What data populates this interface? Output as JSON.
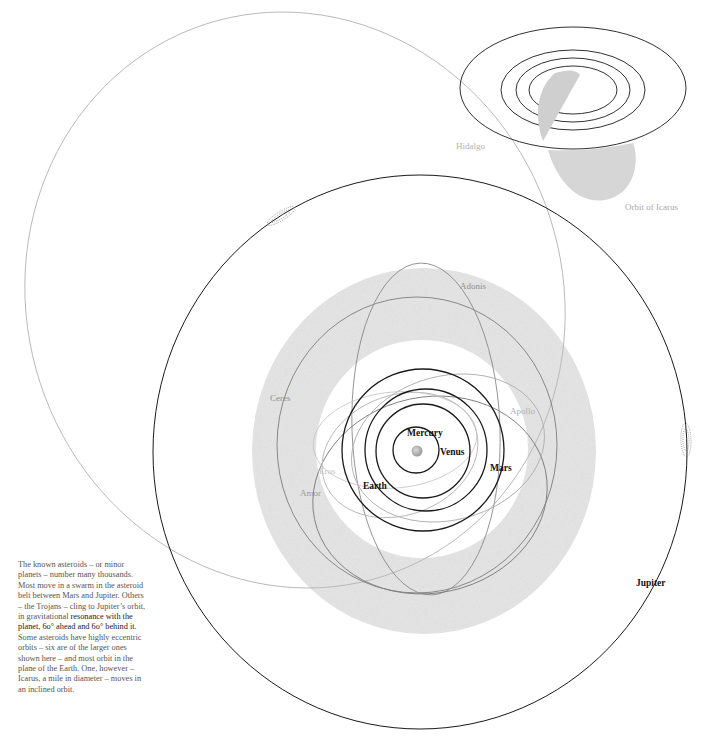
{
  "diagram": {
    "colors": {
      "planet_orbit": "#1a1a1a",
      "asteroid_orbit": "#8a8a8a",
      "faint_orbit": "#b5b5b5",
      "belt": "#e4e4e4",
      "label_dark": "#111111",
      "label_grey": "#9a9a9a",
      "label_light": "#c0c0c0"
    },
    "planets": [
      {
        "name": "Mercury",
        "label": "Mercury"
      },
      {
        "name": "Venus",
        "label": "Venus"
      },
      {
        "name": "Earth",
        "label": "Earth"
      },
      {
        "name": "Mars",
        "label": "Mars"
      },
      {
        "name": "Jupiter",
        "label": "Jupiter"
      }
    ],
    "asteroids": [
      {
        "name": "Ceres",
        "label": "Ceres"
      },
      {
        "name": "Adonis",
        "label": "Adonis"
      },
      {
        "name": "Apollo",
        "label": "Apollo"
      },
      {
        "name": "Eros",
        "label": "Eros"
      },
      {
        "name": "Amor",
        "label": "Amor"
      },
      {
        "name": "Hidalgo",
        "label": "Hidalgo"
      }
    ],
    "inset": {
      "label": "Orbit of Icarus"
    },
    "trojans": [
      {
        "position": "ahead",
        "angle": "60°"
      },
      {
        "position": "behind",
        "angle": "60°"
      }
    ]
  },
  "caption": {
    "part1": "The known asteroids – or minor planets – number many thousands. Most move in a swarm in the asteroid belt between Mars and Jupiter. Others – the Trojans – cling to Jupiter’s orbit, in gravitational ",
    "part2": "resonance with the planet,  6o° ahead and  6o° behind it.",
    "part3": " Some asteroids have highly eccentric orbits – six are of the larger ones shown here – and most orbit in the plane of the Earth. One, however – Icarus, a mile in diameter – moves in an inclined orbit."
  }
}
